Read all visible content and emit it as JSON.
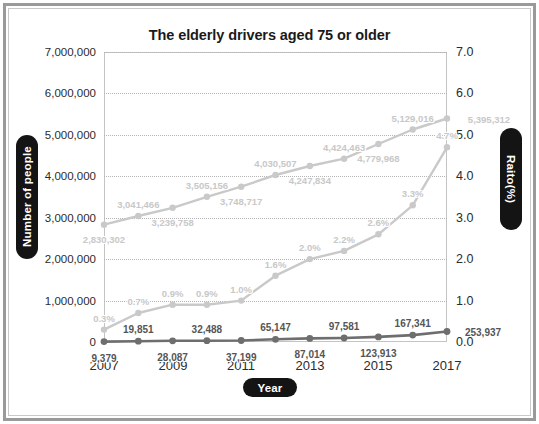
{
  "chart_data": {
    "type": "line",
    "title": "The elderly drivers aged 75 or older",
    "xlabel": "Year",
    "ylabel": "Number of people",
    "ylabel_right": "Raito(%)",
    "grid": true,
    "legend": "none",
    "x": [
      2007,
      2008,
      2009,
      2010,
      2011,
      2012,
      2013,
      2014,
      2015,
      2016,
      2017
    ],
    "xticks": [
      "2007",
      "2009",
      "2011",
      "2013",
      "2015",
      "2017"
    ],
    "xtick_values": [
      2007,
      2009,
      2011,
      2013,
      2015,
      2017
    ],
    "ylim": [
      0,
      7000000
    ],
    "yticks": [
      "0",
      "1,000,000",
      "2,000,000",
      "3,000,000",
      "4,000,000",
      "5,000,000",
      "6,000,000",
      "7,000,000"
    ],
    "ytick_values": [
      0,
      1000000,
      2000000,
      3000000,
      4000000,
      5000000,
      6000000,
      7000000
    ],
    "ylim_right": [
      0.0,
      7.0
    ],
    "yticks_right": [
      "0.0",
      "1.0",
      "2.0",
      "3.0",
      "4.0",
      "5.0",
      "6.0",
      "7.0"
    ],
    "ytick_right_values": [
      0.0,
      1.0,
      2.0,
      3.0,
      4.0,
      5.0,
      6.0,
      7.0
    ],
    "series": [
      {
        "name": "Number of elderly drivers aged 75 or older",
        "axis": "left",
        "color": "#c9c9c9",
        "values": [
          2830302,
          3041466,
          3239758,
          3505156,
          3748717,
          4030507,
          4247834,
          4424463,
          4779968,
          5129016,
          5395312
        ],
        "labels": [
          "2,830,302",
          "3,041,466",
          "3,239,758",
          "3,505,156",
          "3,748,717",
          "4,030,507",
          "4,247,834",
          "4,424,463",
          "4,779,968",
          "5,129,016",
          "5,395,312"
        ]
      },
      {
        "name": "Number of licence returns",
        "axis": "left",
        "color": "#6e6e6e",
        "values": [
          9379,
          19851,
          28087,
          32488,
          37199,
          65147,
          87014,
          97581,
          123913,
          167341,
          253937
        ],
        "labels": [
          "9,379",
          "19,851",
          "28,087",
          "32,488",
          "37,199",
          "65,147",
          "87,014",
          "97,581",
          "123,913",
          "167,341",
          "253,937"
        ]
      },
      {
        "name": "Return rate",
        "axis": "right",
        "color": "#c9c9c9",
        "values": [
          0.3,
          0.7,
          0.9,
          0.9,
          1.0,
          1.6,
          2.0,
          2.2,
          2.6,
          3.3,
          4.7
        ],
        "labels": [
          "0.3%",
          "0.7%",
          "0.9%",
          "0.9%",
          "1.0%",
          "1.6%",
          "2.0%",
          "2.2%",
          "2.6%",
          "3.3%",
          "4.7%"
        ]
      }
    ]
  },
  "colors": {
    "frame": "#9a9a9a",
    "plot_border": "#c4c4c4",
    "grid": "#b5b5b5",
    "pill_bg": "#141414",
    "pill_text": "#ffffff",
    "title_text": "#1a1a1a",
    "tick_text": "#2b2b2b",
    "light_series": "#c9c9c9",
    "dark_series": "#6e6e6e"
  }
}
